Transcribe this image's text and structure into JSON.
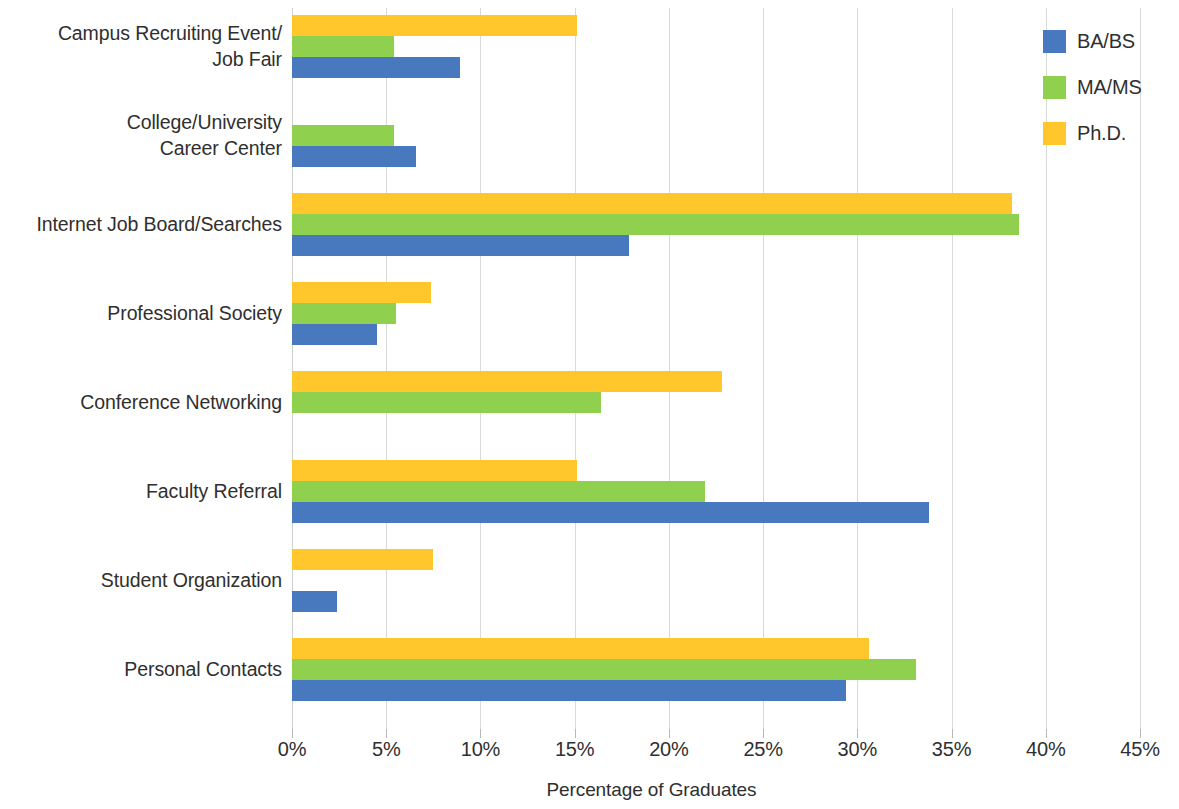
{
  "chart_data": {
    "type": "bar",
    "orientation": "horizontal",
    "title": "",
    "xlabel": "Percentage of Graduates",
    "ylabel": "",
    "xlim": [
      0,
      45
    ],
    "xticks": [
      0,
      5,
      10,
      15,
      20,
      25,
      30,
      35,
      40,
      45
    ],
    "xtick_labels": [
      "0%",
      "5%",
      "10%",
      "15%",
      "20%",
      "25%",
      "30%",
      "35%",
      "40%",
      "45%"
    ],
    "grid": true,
    "grid_axis": "x",
    "legend_position": "top-right",
    "categories": [
      "Campus Recruiting Event/\nJob Fair",
      "College/University\nCareer Center",
      "Internet Job Board/Searches",
      "Professional Society",
      "Conference Networking",
      "Faculty Referral",
      "Student Organization",
      "Personal Contacts"
    ],
    "series": [
      {
        "name": "BA/BS",
        "color": "#4878BE",
        "values": [
          8.9,
          6.6,
          17.9,
          4.5,
          0,
          33.8,
          2.4,
          29.4
        ]
      },
      {
        "name": "MA/MS",
        "color": "#8FD14F",
        "values": [
          5.4,
          5.4,
          38.6,
          5.5,
          16.4,
          21.9,
          0,
          33.1
        ]
      },
      {
        "name": "Ph.D.",
        "color": "#FFC72C",
        "values": [
          15.1,
          0,
          38.2,
          7.4,
          22.8,
          15.1,
          7.5,
          30.6
        ]
      }
    ]
  }
}
